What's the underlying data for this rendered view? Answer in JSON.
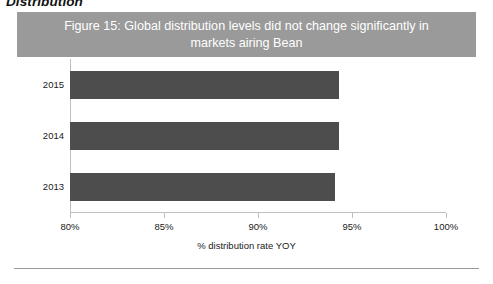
{
  "document": {
    "heading_partial": "Distribution"
  },
  "figure": {
    "title": "Figure 15: Global distribution levels did not change significantly in markets airing Bean",
    "title_bar_color": "#9a9a9a",
    "title_text_color": "#ffffff",
    "bottom_rule_color": "#9a9a9a"
  },
  "chart_data": {
    "type": "bar",
    "orientation": "horizontal",
    "title": "Figure 15: Global distribution levels did not change significantly in markets airing Bean",
    "categories": [
      "2015",
      "2014",
      "2013"
    ],
    "values": [
      94.3,
      94.3,
      94.1
    ],
    "series": [
      {
        "name": "% distribution rate YOY",
        "values": [
          94.3,
          94.3,
          94.1
        ],
        "color": "#4d4d4d"
      }
    ],
    "xlabel": "% distribution rate YOY",
    "ylabel": "",
    "xlim": [
      80,
      100
    ],
    "x_tick_labels": [
      "80%",
      "85%",
      "90%",
      "95%",
      "100%"
    ],
    "x_tick_values": [
      80,
      85,
      90,
      95,
      100
    ],
    "y_tick_labels": [
      "2015",
      "2014",
      "2013"
    ],
    "grid": false,
    "legend": false,
    "axis_color": "#bfbfbf"
  }
}
